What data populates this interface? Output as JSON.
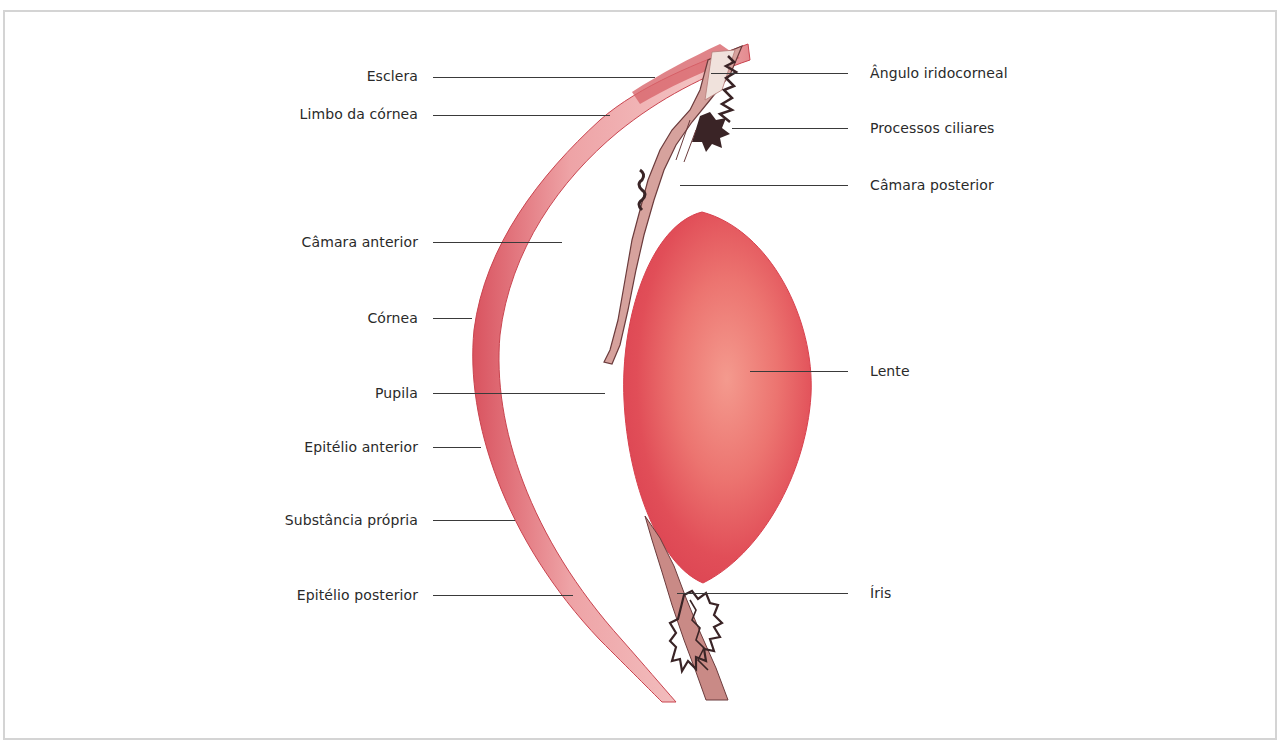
{
  "figure": {
    "colors": {
      "frame_border": "#d4d4d4",
      "cornea": "#e06a72",
      "cornea_inner": "#f0b3b3",
      "lens_outer": "#e04552",
      "lens_inner": "#ef7c78",
      "iris": "#c98a86",
      "pigment": "#3a2426",
      "leader": "#3a3a3a",
      "text": "#2a2a2a"
    },
    "labels_left": [
      {
        "text": "Esclera",
        "y": 76,
        "line_x1": 433,
        "line_x2": 655
      },
      {
        "text": "Limbo da córnea",
        "y": 114,
        "line_x1": 433,
        "line_x2": 610
      },
      {
        "text": "Câmara anterior",
        "y": 242,
        "line_x1": 433,
        "line_x2": 562
      },
      {
        "text": "Córnea",
        "y": 318,
        "line_x1": 433,
        "line_x2": 472
      },
      {
        "text": "Pupila",
        "y": 393,
        "line_x1": 433,
        "line_x2": 605
      },
      {
        "text": "Epitélio anterior",
        "y": 447,
        "line_x1": 433,
        "line_x2": 481
      },
      {
        "text": "Substância própria",
        "y": 520,
        "line_x1": 433,
        "line_x2": 515
      },
      {
        "text": "Epitélio posterior",
        "y": 595,
        "line_x1": 433,
        "line_x2": 573
      }
    ],
    "labels_right": [
      {
        "text": "Ângulo iridocorneal",
        "y": 73,
        "line_x1": 711,
        "line_x2": 848
      },
      {
        "text": "Processos ciliares",
        "y": 128,
        "line_x1": 732,
        "line_x2": 848
      },
      {
        "text": "Câmara posterior",
        "y": 185,
        "line_x1": 680,
        "line_x2": 848
      },
      {
        "text": "Lente",
        "y": 371,
        "line_x1": 750,
        "line_x2": 848
      },
      {
        "text": "Íris",
        "y": 593,
        "line_x1": 677,
        "line_x2": 848
      }
    ]
  }
}
